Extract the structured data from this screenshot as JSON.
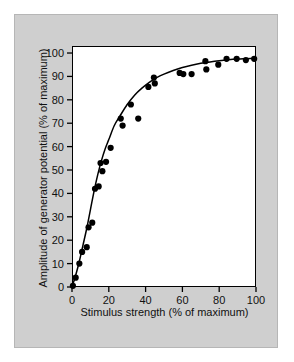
{
  "figure": {
    "background_color": "#ffffff",
    "plate_color": "#cfcfcf",
    "plot_background": "#ffffff",
    "axis_color": "#000000",
    "marker_color": "#000000",
    "curve_color": "#000000"
  },
  "chart_data": {
    "type": "scatter",
    "title": "",
    "xlabel": "Stimulus strength (% of maximum)",
    "ylabel": "Amplitude of generator potential (% of maximum)",
    "xlim": [
      0,
      100
    ],
    "ylim": [
      0,
      103
    ],
    "grid": false,
    "legend": null,
    "xticks": [
      0,
      20,
      40,
      60,
      80,
      100
    ],
    "xtick_labels": [
      "0",
      "20",
      "40",
      "60",
      "80",
      "100"
    ],
    "yticks": [
      0,
      10,
      20,
      30,
      40,
      50,
      60,
      70,
      80,
      90,
      100
    ],
    "ytick_labels": [
      "0",
      "10",
      "20",
      "30",
      "40",
      "50",
      "60",
      "70",
      "80",
      "90",
      "100"
    ],
    "series": [
      {
        "name": "measured generator potential",
        "marker": "filled-circle",
        "x": [
          0.5,
          2.0,
          4.0,
          5.5,
          8.0,
          9.0,
          11.0,
          12.5,
          14.5,
          15.5,
          16.5,
          18.5,
          21.0,
          26.5,
          27.5,
          32.0,
          36.0,
          41.5,
          44.5,
          45.0,
          58.5,
          60.5,
          65.0,
          72.5,
          73.0,
          79.5,
          84.0,
          89.5,
          94.5,
          99.0
        ],
        "y": [
          0.5,
          4.0,
          10.0,
          15.0,
          17.0,
          25.5,
          27.5,
          42.0,
          43.0,
          53.0,
          49.5,
          53.5,
          59.5,
          72.0,
          69.0,
          78.0,
          72.0,
          85.5,
          89.5,
          87.0,
          91.5,
          91.0,
          91.0,
          96.5,
          93.0,
          95.0,
          97.5,
          97.5,
          97.0,
          97.5
        ]
      }
    ],
    "fit_curve": {
      "name": "saturating fit",
      "x": [
        0,
        2,
        4,
        6,
        8,
        10,
        12,
        14,
        16,
        18,
        20,
        23,
        26,
        30,
        34,
        38,
        42,
        46,
        50,
        55,
        60,
        65,
        70,
        75,
        80,
        85,
        90,
        95,
        100
      ],
      "y": [
        0,
        5,
        11,
        18,
        25,
        33,
        41,
        48,
        54,
        59,
        63,
        69,
        73,
        78,
        82,
        85,
        87.5,
        89.5,
        91,
        92.5,
        93.8,
        94.8,
        95.6,
        96.2,
        96.7,
        97.1,
        97.4,
        97.6,
        97.8
      ]
    }
  }
}
